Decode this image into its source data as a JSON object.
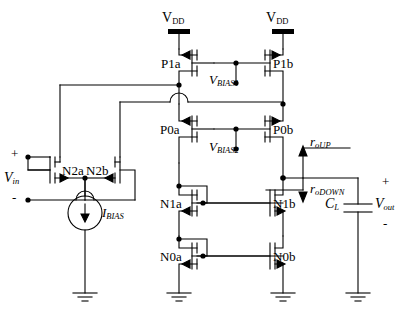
{
  "diagram": {
    "supplies": [
      {
        "name": "vdd-left",
        "label": "V",
        "sub": "DD"
      },
      {
        "name": "vdd-right",
        "label": "V",
        "sub": "DD"
      }
    ],
    "transistors": [
      {
        "id": "P1a",
        "label": "P1a",
        "type": "pmos"
      },
      {
        "id": "P1b",
        "label": "P1b",
        "type": "pmos"
      },
      {
        "id": "P0a",
        "label": "P0a",
        "type": "pmos"
      },
      {
        "id": "P0b",
        "label": "P0b",
        "type": "pmos"
      },
      {
        "id": "N2a",
        "label": "N2a",
        "type": "nmos"
      },
      {
        "id": "N2b",
        "label": "N2b",
        "type": "nmos"
      },
      {
        "id": "N1a",
        "label": "N1a",
        "type": "nmos"
      },
      {
        "id": "N1b",
        "label": "N1b",
        "type": "nmos"
      },
      {
        "id": "N0a",
        "label": "N0a",
        "type": "nmos"
      },
      {
        "id": "N0b",
        "label": "N0b",
        "type": "nmos"
      }
    ],
    "nodes": [
      {
        "name": "vbias1",
        "label": "V",
        "sub": "BIAS1"
      },
      {
        "name": "vbias2",
        "label": "V",
        "sub": "BIAS2"
      }
    ],
    "input": {
      "label": "V",
      "sub": "in",
      "plus": "+",
      "minus": "-"
    },
    "output": {
      "label": "V",
      "sub": "out",
      "plus": "+",
      "minus": "-"
    },
    "current_source": {
      "label": "I",
      "sub": "BIAS"
    },
    "load_cap": {
      "label": "C",
      "sub": "L"
    },
    "resistances": [
      {
        "name": "ro-up",
        "label": "r",
        "sub": "oUP",
        "arrow": "up"
      },
      {
        "name": "ro-down",
        "label": "r",
        "sub": "oDOWN",
        "arrow": "down"
      }
    ],
    "colors": {
      "line": "#000000",
      "background": "#ffffff"
    }
  }
}
